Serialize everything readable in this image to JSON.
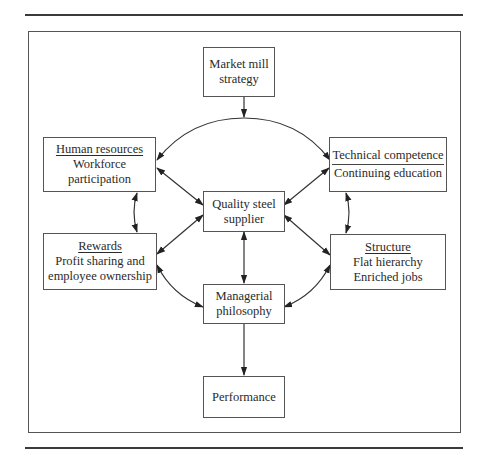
{
  "diagram": {
    "nodes": {
      "market_mill": {
        "lines": [
          "Market mill",
          "strategy"
        ]
      },
      "human_resources": {
        "heading": "Human resources",
        "lines": [
          "Workforce",
          "participation"
        ]
      },
      "technical": {
        "heading": "Technical competence",
        "lines": [
          "Continuing education"
        ]
      },
      "quality": {
        "lines": [
          "Quality steel",
          "supplier"
        ]
      },
      "rewards": {
        "heading": "Rewards",
        "lines": [
          "Profit sharing and",
          "employee ownership"
        ]
      },
      "structure": {
        "heading": "Structure",
        "lines": [
          "Flat hierarchy",
          "Enriched jobs"
        ]
      },
      "managerial": {
        "lines": [
          "Managerial",
          "philosophy"
        ]
      },
      "performance": {
        "lines": [
          "Performance"
        ]
      }
    },
    "edges": [
      {
        "from": "market_mill",
        "to": "arc",
        "type": "one-way"
      },
      {
        "from": "arc",
        "to": "human_resources",
        "type": "one-way"
      },
      {
        "from": "arc",
        "to": "technical",
        "type": "one-way"
      },
      {
        "from": "human_resources",
        "to": "rewards",
        "type": "two-way"
      },
      {
        "from": "technical",
        "to": "structure",
        "type": "two-way"
      },
      {
        "from": "human_resources",
        "to": "quality",
        "type": "two-way"
      },
      {
        "from": "rewards",
        "to": "quality",
        "type": "two-way"
      },
      {
        "from": "technical",
        "to": "quality",
        "type": "two-way"
      },
      {
        "from": "structure",
        "to": "quality",
        "type": "two-way"
      },
      {
        "from": "quality",
        "to": "managerial",
        "type": "two-way"
      },
      {
        "from": "rewards",
        "to": "managerial",
        "type": "two-way"
      },
      {
        "from": "structure",
        "to": "managerial",
        "type": "two-way"
      },
      {
        "from": "managerial",
        "to": "performance",
        "type": "one-way"
      }
    ],
    "colors": {
      "line": "#333333",
      "frame": "#555555",
      "text": "#2a2a2a"
    }
  }
}
